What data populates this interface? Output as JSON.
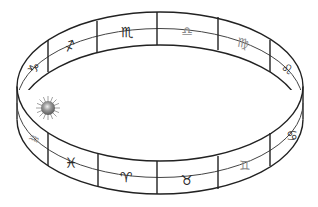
{
  "diagram": {
    "line_color": "#222222",
    "signs": [
      {
        "name": "Capricorn",
        "symbol": "♑",
        "x": 34,
        "y": 68,
        "size": 13,
        "rot": -55,
        "shade": "dark"
      },
      {
        "name": "Sagittarius",
        "symbol": "♐",
        "x": 70,
        "y": 46,
        "size": 13,
        "rot": -20,
        "shade": "dark"
      },
      {
        "name": "Scorpio",
        "symbol": "♏",
        "x": 127,
        "y": 32,
        "size": 14,
        "rot": 0,
        "shade": "dark"
      },
      {
        "name": "Libra",
        "symbol": "♎",
        "x": 187,
        "y": 31,
        "size": 13,
        "rot": 0,
        "shade": "light"
      },
      {
        "name": "Virgo",
        "symbol": "♍",
        "x": 243,
        "y": 43,
        "size": 13,
        "rot": 10,
        "shade": "light"
      },
      {
        "name": "Leo",
        "symbol": "♌",
        "x": 287,
        "y": 69,
        "size": 13,
        "rot": 20,
        "shade": "dark"
      },
      {
        "name": "Cancer",
        "symbol": "♋",
        "x": 292,
        "y": 135,
        "size": 13,
        "rot": 0,
        "shade": "dark"
      },
      {
        "name": "Gemini",
        "symbol": "♊",
        "x": 245,
        "y": 165,
        "size": 13,
        "rot": 0,
        "shade": "light"
      },
      {
        "name": "Taurus",
        "symbol": "♉",
        "x": 187,
        "y": 180,
        "size": 14,
        "rot": 0,
        "shade": "dark"
      },
      {
        "name": "Aries",
        "symbol": "♈",
        "x": 126,
        "y": 177,
        "size": 14,
        "rot": 0,
        "shade": "dark"
      },
      {
        "name": "Pisces",
        "symbol": "♓",
        "x": 71,
        "y": 163,
        "size": 14,
        "rot": 0,
        "shade": "dark"
      },
      {
        "name": "Aquarius",
        "symbol": "♒",
        "x": 34,
        "y": 139,
        "size": 13,
        "rot": 25,
        "shade": "light"
      }
    ],
    "sun": {
      "label": "Sun",
      "x": 48,
      "y": 108,
      "r": 8,
      "color": "#7a7a7a"
    }
  }
}
